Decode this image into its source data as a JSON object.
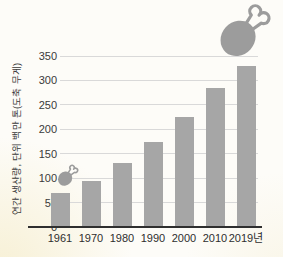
{
  "chart_data": {
    "type": "bar",
    "title": "",
    "categories": [
      "1961",
      "1970",
      "1980",
      "1990",
      "2000",
      "2010",
      "2019년"
    ],
    "values": [
      70,
      95,
      130,
      175,
      225,
      285,
      330
    ],
    "xlabel": "",
    "ylabel": "연간 생산량, 단위 백만 톤(도축 무게)",
    "ylim": [
      0,
      350
    ],
    "yticks": [
      0,
      50,
      100,
      150,
      200,
      250,
      300,
      350
    ],
    "ytick_interval": 50,
    "grid": true,
    "legend": false
  },
  "icons": {
    "top_right": "chicken-drumstick-icon",
    "near_first_bar": "chicken-drumstick-icon"
  },
  "colors": {
    "bar": "#a6a6a6",
    "gridline": "#d9d9d9",
    "axis_line": "#2f2f2f",
    "tick_text": "#3a3a3a",
    "icon": "#9c9c9c",
    "background": "#fdfcf8"
  }
}
